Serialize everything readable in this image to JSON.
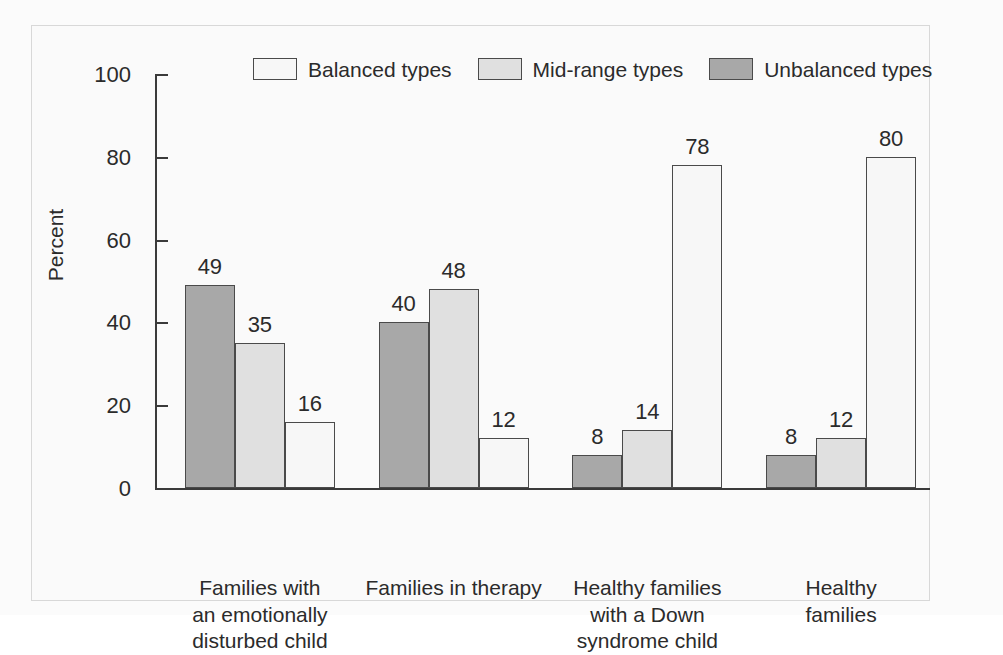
{
  "chart_data": {
    "type": "bar",
    "title": "",
    "subtitle": "",
    "xlabel": "",
    "ylabel": "Percent",
    "ylim": [
      0,
      100
    ],
    "yticks": [
      0,
      20,
      40,
      60,
      80,
      100
    ],
    "ytick_labels": [
      "0",
      "20",
      "40",
      "60",
      "80",
      "100"
    ],
    "grid": false,
    "legend_position": "top",
    "categories": [
      "Families with\nan emotionally\ndisturbed child",
      "Families in therapy",
      "Healthy families\nwith a Down\nsyndrome child",
      "Healthy families"
    ],
    "series": [
      {
        "name": "Unbalanced types",
        "color": "#a8a8a8",
        "values": [
          49,
          40,
          8,
          8
        ],
        "labels": [
          "49",
          "40",
          "8",
          "8"
        ]
      },
      {
        "name": "Mid-range types",
        "color": "#e0e0e0",
        "values": [
          35,
          48,
          14,
          12
        ],
        "labels": [
          "35",
          "48",
          "14",
          "12"
        ]
      },
      {
        "name": "Balanced types",
        "color": "#f7f7f7",
        "values": [
          16,
          12,
          78,
          80
        ],
        "labels": [
          "16",
          "12",
          "78",
          "80"
        ]
      }
    ],
    "legend_order": [
      "Balanced types",
      "Mid-range types",
      "Unbalanced types"
    ],
    "bar_order_in_group": [
      "Unbalanced types",
      "Mid-range types",
      "Balanced types"
    ]
  },
  "legend": {
    "items": [
      {
        "label": "Balanced types",
        "color": "#f7f7f7"
      },
      {
        "label": "Mid-range types",
        "color": "#e0e0e0"
      },
      {
        "label": "Unbalanced types",
        "color": "#a8a8a8"
      }
    ]
  },
  "axes": {
    "y_title": "Percent",
    "y_tick_labels": [
      "100",
      "80",
      "60",
      "40",
      "20",
      "0"
    ]
  },
  "colors": {
    "balanced": "#f7f7f7",
    "mid_range": "#e0e0e0",
    "unbalanced": "#a8a8a8",
    "outline": "#4a4a4a",
    "text": "#2b2b2b",
    "frame": "#d8d8d8",
    "background": "#fafafa"
  }
}
